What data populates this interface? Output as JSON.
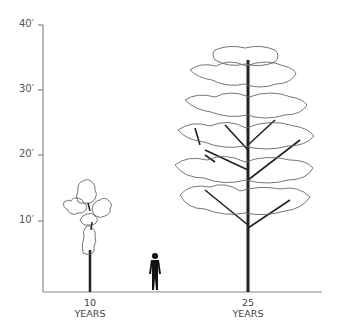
{
  "diagram": {
    "type": "tree-growth-height-comparison",
    "y_axis": {
      "ticks": [
        {
          "label": "40′",
          "value": 40
        },
        {
          "label": "30′",
          "value": 30
        },
        {
          "label": "20′",
          "value": 20
        },
        {
          "label": "10′",
          "value": 10
        }
      ]
    },
    "x_labels": [
      {
        "line1": "10",
        "line2": "YEARS"
      },
      {
        "line1": "25",
        "line2": "YEARS"
      }
    ],
    "figures": [
      {
        "name": "tree-10-years",
        "approx_height_ft": 16
      },
      {
        "name": "human-figure",
        "approx_height_ft": 6
      },
      {
        "name": "tree-25-years",
        "approx_height_ft": 37
      }
    ],
    "colors": {
      "axis": "#888888",
      "outline": "#555555",
      "trunk": "#222222"
    }
  }
}
